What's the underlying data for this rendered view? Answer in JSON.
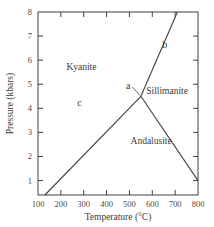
{
  "chart_data": {
    "type": "line",
    "title": "",
    "xlabel": "Temperature (°C)",
    "ylabel": "Pressure (kbars)",
    "xlim": [
      100,
      800
    ],
    "ylim": [
      0.4,
      8
    ],
    "xticks": [
      100,
      200,
      300,
      400,
      500,
      600,
      700,
      800
    ],
    "yticks": [
      1,
      2,
      3,
      4,
      5,
      6,
      7,
      8
    ],
    "grid": false,
    "series": [
      {
        "name": "Kyanite-Andalusite boundary",
        "x": [
          130,
          550
        ],
        "y": [
          0.4,
          4.5
        ]
      },
      {
        "name": "Andalusite-Sillimanite boundary",
        "x": [
          550,
          800
        ],
        "y": [
          4.5,
          1.0
        ]
      },
      {
        "name": "Kyanite-Sillimanite boundary",
        "x": [
          550,
          710
        ],
        "y": [
          4.5,
          8.0
        ]
      }
    ],
    "regions": [
      {
        "label": "Kyanite",
        "x": 290,
        "y": 5.6
      },
      {
        "label": "Sillimanite",
        "x": 665,
        "y": 4.6
      },
      {
        "label": "Andalusite",
        "x": 595,
        "y": 2.5
      }
    ],
    "annotations": [
      {
        "label": "a",
        "x": 495,
        "y": 4.8,
        "pointer_to": [
          550,
          4.5
        ]
      },
      {
        "label": "b",
        "x": 655,
        "y": 6.5
      },
      {
        "label": "c",
        "x": 282,
        "y": 4.1
      }
    ]
  }
}
